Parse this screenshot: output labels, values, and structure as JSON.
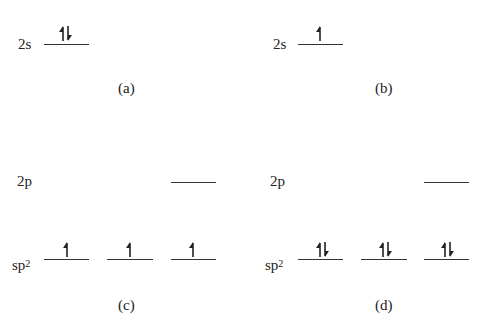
{
  "diagram": {
    "type": "orbital-energy-level-diagram",
    "panels": [
      {
        "id": "a",
        "caption": "(a)",
        "levels": [
          {
            "label": "2s",
            "orbitals": [
              {
                "electrons": [
                  "up",
                  "down"
                ]
              }
            ]
          }
        ]
      },
      {
        "id": "b",
        "caption": "(b)",
        "levels": [
          {
            "label": "2s",
            "orbitals": [
              {
                "electrons": [
                  "up"
                ]
              }
            ]
          }
        ]
      },
      {
        "id": "c",
        "caption": "(c)",
        "levels": [
          {
            "label": "2p",
            "orbitals": [
              {
                "electrons": []
              }
            ]
          },
          {
            "label": "sp",
            "superscript": "2",
            "orbitals": [
              {
                "electrons": [
                  "up"
                ]
              },
              {
                "electrons": [
                  "up"
                ]
              },
              {
                "electrons": [
                  "up"
                ]
              }
            ]
          }
        ]
      },
      {
        "id": "d",
        "caption": "(d)",
        "levels": [
          {
            "label": "2p",
            "orbitals": [
              {
                "electrons": []
              }
            ]
          },
          {
            "label": "sp",
            "superscript": "2",
            "orbitals": [
              {
                "electrons": [
                  "up",
                  "down"
                ]
              },
              {
                "electrons": [
                  "up",
                  "down"
                ]
              },
              {
                "electrons": [
                  "up",
                  "down"
                ]
              }
            ]
          }
        ]
      }
    ]
  },
  "labels": {
    "a_2s": "2s",
    "b_2s": "2s",
    "c_2p": "2p",
    "c_sp": "sp",
    "c_sp_sup": "2",
    "d_2p": "2p",
    "d_sp": "sp",
    "d_sp_sup": "2"
  },
  "captions": {
    "a": "(a)",
    "b": "(b)",
    "c": "(c)",
    "d": "(d)"
  },
  "colors": {
    "ink": "#222222",
    "line": "#333333",
    "background": "#ffffff"
  }
}
